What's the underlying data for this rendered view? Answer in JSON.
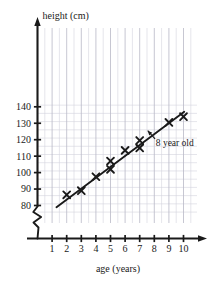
{
  "chart_data": {
    "type": "scatter",
    "title": "",
    "xlabel": "age (years)",
    "ylabel": "height (cm)",
    "xlim": [
      0,
      10.6
    ],
    "ylim": [
      75,
      142
    ],
    "grid": true,
    "legend_position": "none",
    "x_ticks": [
      1,
      2,
      3,
      4,
      5,
      6,
      7,
      8,
      9,
      10
    ],
    "x_tick_labels": [
      "1",
      "2",
      "3",
      "4",
      "5",
      "6",
      "7",
      "8",
      "9",
      "10"
    ],
    "y_ticks": [
      80,
      90,
      100,
      110,
      120,
      130,
      140
    ],
    "y_tick_labels": [
      "80",
      "90",
      "100",
      "110",
      "120",
      "130",
      "140"
    ],
    "y_axis_break": true,
    "y_minor_step": 5,
    "marker": "x",
    "points": [
      {
        "x": 2,
        "y": 86.5
      },
      {
        "x": 3,
        "y": 89
      },
      {
        "x": 4,
        "y": 97.5
      },
      {
        "x": 5,
        "y": 107
      },
      {
        "x": 5,
        "y": 102
      },
      {
        "x": 6,
        "y": 113.5
      },
      {
        "x": 7,
        "y": 119.5
      },
      {
        "x": 7,
        "y": 115
      },
      {
        "x": 9,
        "y": 130.5
      },
      {
        "x": 10,
        "y": 134
      }
    ],
    "trend_line": {
      "x1": 1.3,
      "y1": 79,
      "x2": 10.05,
      "y2": 137
    },
    "annotations": [
      {
        "text": "8 year old",
        "x": 8.1,
        "y": 118.5,
        "arrow_from_x": 8.05,
        "arrow_from_y": 120.5,
        "arrow_to_x": 7.55,
        "arrow_to_y": 125.5
      }
    ]
  },
  "colors": {
    "axis": "#1a1a1a",
    "grid_major": "#b9b9c6",
    "grid_minor": "#d4d4de",
    "marker": "#1a1a1a",
    "line": "#1a1a1a",
    "background": "#ffffff"
  }
}
